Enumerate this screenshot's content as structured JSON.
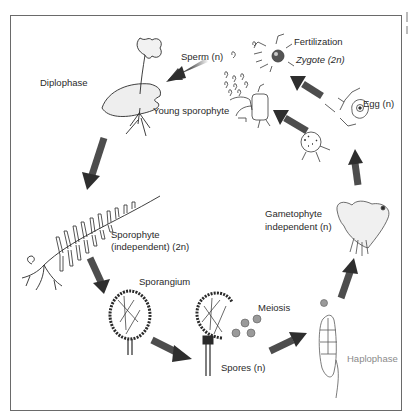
{
  "diagram": {
    "phases": {
      "diploid": "Diplophase",
      "haploid": "Haplophase"
    },
    "labels": {
      "sperm": "Sperm (n)",
      "fertilization": "Fertilization",
      "zygote": "Zygote (2n)",
      "young_sporophyte": "Young sporophyte",
      "egg": "Egg (n)",
      "sporophyte_line1": "Sporophyte",
      "sporophyte_line2": "(independent) (2n)",
      "sporangium": "Sporangium",
      "meiosis": "Meiosis",
      "spores": "Spores (n)",
      "gametophyte_line1": "Gametophyte",
      "gametophyte_line2": "independent (n)"
    },
    "cycle_order": [
      "Young sporophyte",
      "Sporophyte (independent) (2n)",
      "Sporangium",
      "Meiosis / Spores (n)",
      "Germinating spore",
      "Gametophyte independent (n)",
      "Egg (n)",
      "Fertilization / Zygote (2n)",
      "Sperm (n)"
    ],
    "colors": {
      "arrow": "#3a3a3a",
      "line": "#2a2a2a",
      "haplophase_text": "#8a8a8a",
      "frame": "#6a6a6a"
    }
  }
}
